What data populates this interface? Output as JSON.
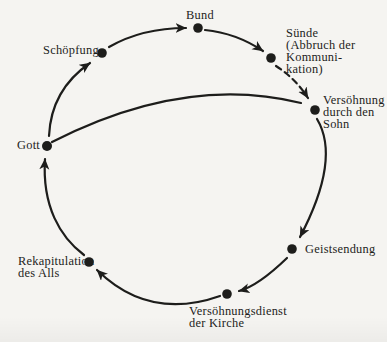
{
  "colors": {
    "paper": "#f5f4f1",
    "ink": "#1d1d1b"
  },
  "diagram": {
    "type": "circular-cycle-diagram",
    "language": "de",
    "nodes": {
      "gott": {
        "label": "Gott"
      },
      "schoepfung": {
        "label": "Schöpfung"
      },
      "bund": {
        "label": "Bund"
      },
      "suende": {
        "lines": [
          "Sünde",
          "(Abbruch der",
          "Kommuni-",
          "kation)"
        ]
      },
      "versoehnung_sohn": {
        "lines": [
          "Versöhnung",
          "durch den",
          "Sohn"
        ]
      },
      "geistsendung": {
        "label": "Geistsendung"
      },
      "versoehnungsdienst": {
        "lines": [
          "Versöhnungsdienst",
          "der Kirche"
        ]
      },
      "rekapitulation": {
        "lines": [
          "Rekapitulation",
          "des Alls"
        ]
      }
    },
    "edges": [
      {
        "from": "Gott",
        "to": "Schöpfung",
        "style": "solid-arrow"
      },
      {
        "from": "Schöpfung",
        "to": "Bund",
        "style": "solid-arrow"
      },
      {
        "from": "Bund",
        "to": "Sünde (Abbruch der Kommunikation)",
        "style": "solid-arrow"
      },
      {
        "from": "Sünde (Abbruch der Kommunikation)",
        "to": "Versöhnung durch den Sohn",
        "style": "dashed-arrow"
      },
      {
        "from": "Versöhnung durch den Sohn",
        "to": "Geistsendung",
        "style": "solid-arrow"
      },
      {
        "from": "Geistsendung",
        "to": "Versöhnungsdienst der Kirche",
        "style": "solid-arrow"
      },
      {
        "from": "Versöhnungsdienst der Kirche",
        "to": "Rekapitulation des Alls",
        "style": "solid-arrow"
      },
      {
        "from": "Rekapitulation des Alls",
        "to": "Gott",
        "style": "solid-arrow"
      },
      {
        "from": "Gott",
        "to": "Versöhnung durch den Sohn",
        "style": "plain-line"
      }
    ]
  }
}
